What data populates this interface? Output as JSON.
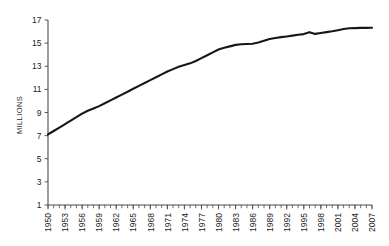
{
  "chart_data": {
    "type": "line",
    "title": "",
    "subtitle": "",
    "xlabel": "",
    "ylabel": "MILLIONS",
    "ylim": [
      1,
      17
    ],
    "xlim": [
      1950,
      2007
    ],
    "grid": false,
    "legend": null,
    "y_ticks": [
      "1",
      "3",
      "5",
      "7",
      "9",
      "11",
      "13",
      "15",
      "17"
    ],
    "y_tick_values": [
      1,
      3,
      5,
      7,
      9,
      11,
      13,
      15,
      17
    ],
    "x_ticks": [
      "1950",
      "1953",
      "1956",
      "1959",
      "1962",
      "1965",
      "1968",
      "1971",
      "1974",
      "1977",
      "1980",
      "1983",
      "1986",
      "1989",
      "1992",
      "1995",
      "1998",
      "2001",
      "2004",
      "2007"
    ],
    "x_tick_values": [
      1950,
      1953,
      1956,
      1959,
      1962,
      1965,
      1968,
      1971,
      1974,
      1977,
      1980,
      1983,
      1986,
      1989,
      1992,
      1995,
      1998,
      2001,
      2004,
      2007
    ],
    "x_minor_interval": 1,
    "series": [
      {
        "name": "Population",
        "color": "#171717",
        "x": [
          1950,
          1951,
          1952,
          1953,
          1954,
          1955,
          1956,
          1957,
          1958,
          1959,
          1960,
          1961,
          1962,
          1963,
          1964,
          1965,
          1966,
          1967,
          1968,
          1969,
          1970,
          1971,
          1972,
          1973,
          1974,
          1975,
          1976,
          1977,
          1978,
          1979,
          1980,
          1981,
          1982,
          1983,
          1984,
          1985,
          1986,
          1987,
          1988,
          1989,
          1990,
          1991,
          1992,
          1993,
          1994,
          1995,
          1996,
          1997,
          1998,
          1999,
          2000,
          2001,
          2002,
          2003,
          2004,
          2005,
          2006,
          2007
        ],
        "values": [
          7.1,
          7.4,
          7.7,
          8.0,
          8.3,
          8.6,
          8.9,
          9.15,
          9.35,
          9.55,
          9.8,
          10.05,
          10.3,
          10.55,
          10.8,
          11.05,
          11.3,
          11.55,
          11.8,
          12.05,
          12.3,
          12.55,
          12.75,
          12.95,
          13.1,
          13.25,
          13.45,
          13.7,
          13.95,
          14.2,
          14.45,
          14.6,
          14.72,
          14.85,
          14.9,
          14.92,
          14.95,
          15.05,
          15.2,
          15.35,
          15.45,
          15.52,
          15.58,
          15.65,
          15.72,
          15.78,
          15.95,
          15.8,
          15.88,
          15.95,
          16.02,
          16.12,
          16.22,
          16.28,
          16.3,
          16.32,
          16.32,
          16.33
        ]
      }
    ]
  },
  "axis": {
    "y_axis_title": "MILLIONS"
  }
}
